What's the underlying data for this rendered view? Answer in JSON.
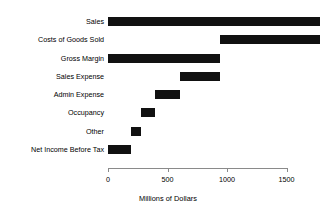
{
  "chart_data": {
    "type": "bar",
    "subtype": "waterfall",
    "orientation": "horizontal",
    "title": "",
    "xlabel": "Millions of Dollars",
    "ylabel": "",
    "xlim": [
      0,
      1780
    ],
    "xticks": [
      0,
      500,
      1000,
      1500
    ],
    "xtick_labels": [
      "0",
      "500",
      "1000",
      "1500"
    ],
    "grid": false,
    "legend": "none",
    "bar_color": "#111111",
    "axis_color": "#8a8a8a",
    "categories": [
      "Sales",
      "Costs of Goods Sold",
      "Gross Margin",
      "Sales Expense",
      "Admin Expense",
      "Occupancy",
      "Other",
      "Net Income Before Tax"
    ],
    "bars": [
      {
        "label": "Sales",
        "start": 0,
        "end": 1780,
        "value": 1780
      },
      {
        "label": "Costs of Goods Sold",
        "start": 940,
        "end": 1780,
        "value": 840
      },
      {
        "label": "Gross Margin",
        "start": 0,
        "end": 940,
        "value": 940
      },
      {
        "label": "Sales Expense",
        "start": 605,
        "end": 940,
        "value": 335
      },
      {
        "label": "Admin Expense",
        "start": 395,
        "end": 605,
        "value": 210
      },
      {
        "label": "Occupancy",
        "start": 277,
        "end": 395,
        "value": 118
      },
      {
        "label": "Other",
        "start": 193,
        "end": 277,
        "value": 84
      },
      {
        "label": "Net Income Before Tax",
        "start": 0,
        "end": 193,
        "value": 193
      }
    ],
    "values": [
      1780,
      840,
      940,
      335,
      210,
      118,
      84,
      193
    ]
  }
}
